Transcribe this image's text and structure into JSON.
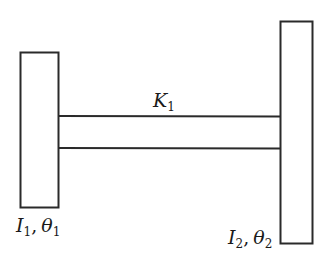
{
  "diagram": {
    "colors": {
      "stroke": "#2a2a2a",
      "background": "#ffffff"
    },
    "rotor_left": {
      "label": {
        "inertia": "I",
        "inertia_sub": "1",
        "sep": ",",
        "angle": "θ",
        "angle_sub": "1"
      }
    },
    "rotor_right": {
      "label": {
        "inertia": "I",
        "inertia_sub": "2",
        "sep": ",",
        "angle": "θ",
        "angle_sub": "2"
      }
    },
    "shaft": {
      "label": {
        "stiffness": "K",
        "stiffness_sub": "1"
      }
    }
  }
}
